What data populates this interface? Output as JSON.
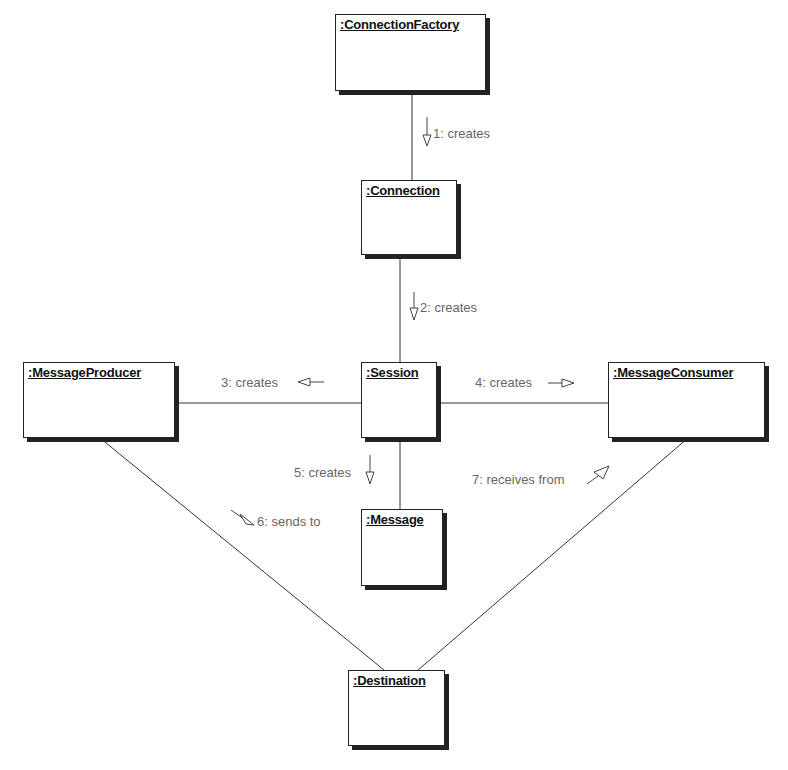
{
  "diagram": {
    "type": "UML collaboration diagram",
    "objects": [
      {
        "id": "cf",
        "name": ":ConnectionFactory",
        "x": 335,
        "y": 14,
        "w": 151,
        "h": 77
      },
      {
        "id": "conn",
        "name": ":Connection",
        "x": 361,
        "y": 180,
        "w": 96,
        "h": 75
      },
      {
        "id": "session",
        "name": ":Session",
        "x": 361,
        "y": 362,
        "w": 76,
        "h": 76
      },
      {
        "id": "producer",
        "name": ":MessageProducer",
        "x": 23,
        "y": 362,
        "w": 152,
        "h": 76
      },
      {
        "id": "consumer",
        "name": ":MessageConsumer",
        "x": 608,
        "y": 362,
        "w": 157,
        "h": 76
      },
      {
        "id": "message",
        "name": ":Message",
        "x": 361,
        "y": 509,
        "w": 82,
        "h": 77
      },
      {
        "id": "dest",
        "name": ":Destination",
        "x": 348,
        "y": 670,
        "w": 97,
        "h": 76
      }
    ],
    "messages": [
      {
        "id": "m1",
        "text": "1: creates",
        "from": "ConnectionFactory",
        "to": "Connection",
        "direction": "down"
      },
      {
        "id": "m2",
        "text": "2: creates",
        "from": "Connection",
        "to": "Session",
        "direction": "down"
      },
      {
        "id": "m3",
        "text": "3: creates",
        "from": "Session",
        "to": "MessageProducer",
        "direction": "left"
      },
      {
        "id": "m4",
        "text": "4: creates",
        "from": "Session",
        "to": "MessageConsumer",
        "direction": "right"
      },
      {
        "id": "m5",
        "text": "5: creates",
        "from": "Session",
        "to": "Message",
        "direction": "down"
      },
      {
        "id": "m6",
        "text": "6: sends to",
        "from": "MessageProducer",
        "to": "Destination",
        "direction": "down-right"
      },
      {
        "id": "m7",
        "text": "7: receives from",
        "from": "Destination",
        "to": "MessageConsumer",
        "direction": "up-right"
      }
    ],
    "colors": {
      "line": "#333333",
      "shadow": "#222222",
      "label": "#666666"
    }
  }
}
